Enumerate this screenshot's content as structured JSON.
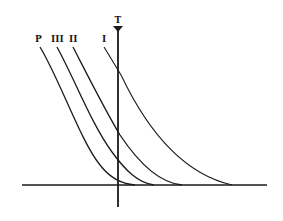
{
  "diagram": {
    "title": "",
    "axis_marker_label": "T",
    "curves": [
      {
        "label": "P",
        "label_x": 39,
        "label_y": 42
      },
      {
        "label": "III",
        "label_x": 58,
        "label_y": 42
      },
      {
        "label": "II",
        "label_x": 74,
        "label_y": 42
      },
      {
        "label": "I",
        "label_x": 104,
        "label_y": 42
      }
    ],
    "colors": {
      "line": "#1a1a1a",
      "background": "#ffffff"
    }
  }
}
